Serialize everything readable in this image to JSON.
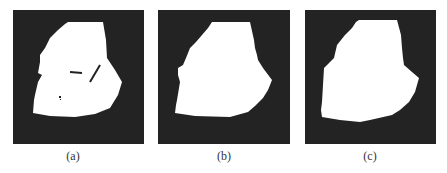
{
  "figure": {
    "panels": [
      {
        "label": "(a)",
        "description": "Binary segmentation mask with small holes",
        "box": {
          "x": 13,
          "y": 10,
          "w": 131,
          "h": 134
        },
        "caption_x": 73,
        "mask_points": "68,22 103,22 106,40 107,58 115,70 122,82 118,95 110,108 95,114 75,117 50,116 33,113 34,100 35,95 38,82 42,75 38,73 40,62 40,55 45,48 50,38 58,30 65,24",
        "holes": [
          {
            "type": "line",
            "x1": 70,
            "y1": 72,
            "x2": 82,
            "y2": 73,
            "w": 2
          },
          {
            "type": "line",
            "x1": 100,
            "y1": 65,
            "x2": 90,
            "y2": 82,
            "w": 2
          },
          {
            "type": "rect",
            "x": 59,
            "y": 96,
            "w": 2,
            "h": 2
          },
          {
            "type": "rect",
            "x": 60,
            "y": 99,
            "w": 1,
            "h": 1
          }
        ]
      },
      {
        "label": "(b)",
        "description": "Mask after hole filling",
        "box": {
          "x": 158,
          "y": 10,
          "w": 132,
          "h": 134
        },
        "caption_x": 224,
        "mask_points": "212,22 250,22 254,40 255,48 257,55 258,60 263,68 272,80 268,90 263,98 255,106 248,112 230,117 195,116 175,113 176,105 177,100 180,82 178,75 178,68 183,65 186,58 190,48 196,42 202,35 208,28"
      },
      {
        "label": "(c)",
        "description": "Smoothed final mask",
        "box": {
          "x": 305,
          "y": 10,
          "w": 131,
          "h": 134
        },
        "caption_x": 370,
        "mask_points": "359,20 397,20 401,35 402,48 403,58 404,65 412,72 419,78 415,92 409,102 400,110 392,115 370,120 360,122 340,120 322,117 321,110 322,102 323,85 324,68 330,62 334,58 337,45 345,35 352,28 356,22"
      }
    ],
    "colors": {
      "panel_bg": "#232323",
      "mask": "#ffffff",
      "hole": "#232323",
      "caption": "#333333"
    }
  }
}
